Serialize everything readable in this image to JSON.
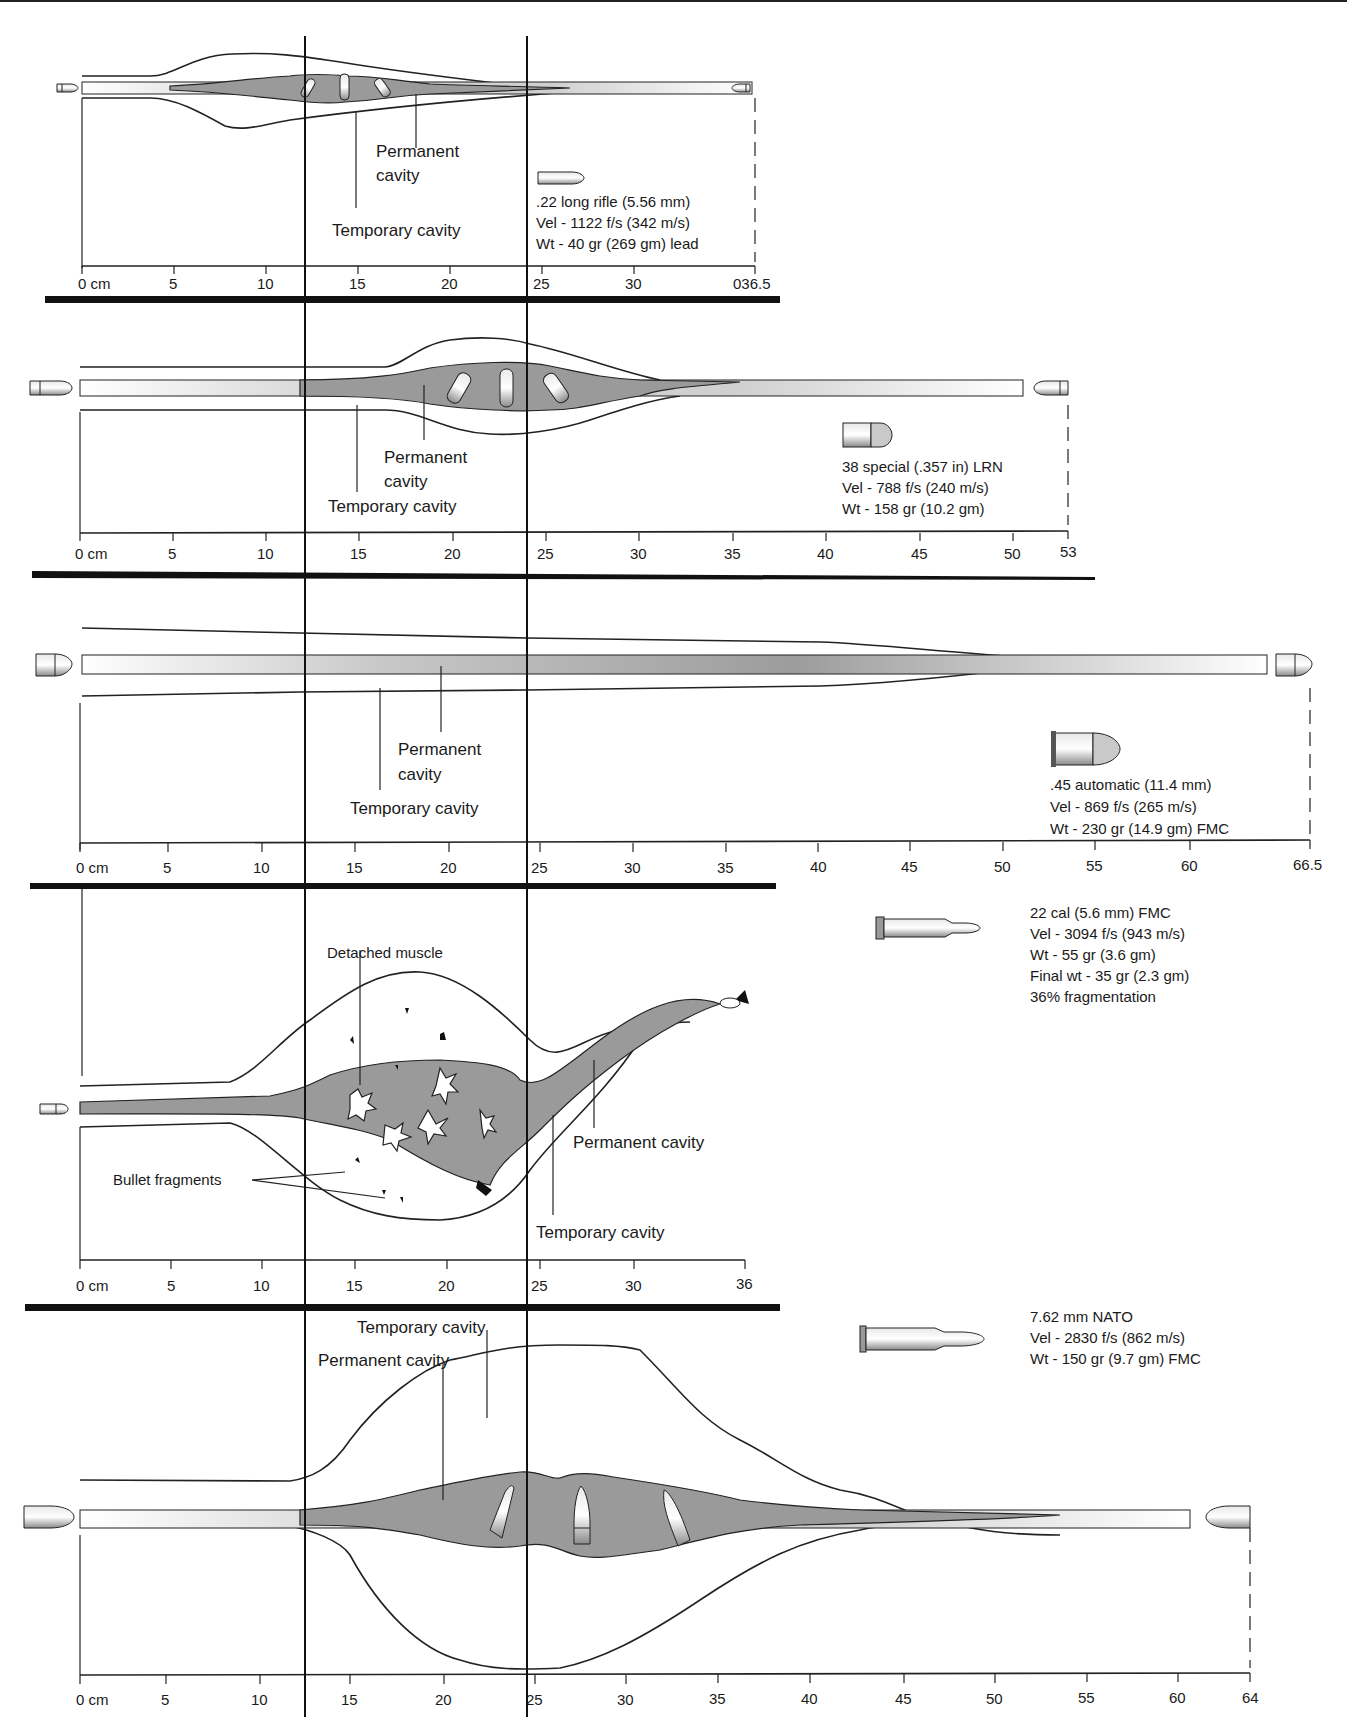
{
  "figure": {
    "reference_lines_x": [
      305,
      527
    ]
  },
  "panels": [
    {
      "id": "p1",
      "cartridge": ".22 long rifle (5.56 mm)",
      "velocity": "Vel - 1122 f/s (342 m/s)",
      "weight": "Wt - 40 gr (269 gm) lead",
      "labels": {
        "permanent_1": "Permanent",
        "permanent_2": "cavity",
        "temporary": "Temporary cavity"
      },
      "axis": {
        "ticks": [
          "0 cm",
          "5",
          "10",
          "15",
          "20",
          "25",
          "30",
          "036.5"
        ],
        "max_cm": 36.5
      }
    },
    {
      "id": "p2",
      "cartridge": "38 special (.357 in) LRN",
      "velocity": "Vel - 788 f/s (240 m/s)",
      "weight": "Wt - 158 gr (10.2 gm)",
      "labels": {
        "permanent_1": "Permanent",
        "permanent_2": "cavity",
        "temporary": "Temporary cavity"
      },
      "axis": {
        "ticks": [
          "0 cm",
          "5",
          "10",
          "15",
          "20",
          "25",
          "30",
          "35",
          "40",
          "45",
          "50",
          "53"
        ],
        "max_cm": 53
      }
    },
    {
      "id": "p3",
      "cartridge": ".45 automatic (11.4 mm)",
      "velocity": "Vel - 869 f/s (265 m/s)",
      "weight": "Wt - 230 gr (14.9 gm) FMC",
      "labels": {
        "permanent_1": "Permanent",
        "permanent_2": "cavity",
        "temporary": "Temporary cavity"
      },
      "axis": {
        "ticks": [
          "0 cm",
          "5",
          "10",
          "15",
          "20",
          "25",
          "30",
          "35",
          "40",
          "45",
          "50",
          "55",
          "60",
          "66.5"
        ],
        "max_cm": 66.5
      }
    },
    {
      "id": "p4",
      "cartridge": "22 cal (5.6 mm) FMC",
      "velocity": "Vel - 3094 f/s (943 m/s)",
      "weight": "Wt - 55 gr (3.6 gm)",
      "final_weight": "Final wt - 35 gr (2.3 gm)",
      "fragmentation": "36% fragmentation",
      "labels": {
        "detached": "Detached muscle",
        "fragments": "Bullet fragments",
        "permanent": "Permanent cavity",
        "temporary": "Temporary cavity"
      },
      "axis": {
        "ticks": [
          "0 cm",
          "5",
          "10",
          "15",
          "20",
          "25",
          "30",
          "36"
        ],
        "max_cm": 36
      }
    },
    {
      "id": "p5",
      "cartridge": "7.62 mm NATO",
      "velocity": "Vel - 2830 f/s (862 m/s)",
      "weight": "Wt - 150 gr (9.7 gm) FMC",
      "labels": {
        "temporary": "Temporary cavity",
        "permanent": "Permanent cavity"
      },
      "axis": {
        "ticks": [
          "0 cm",
          "5",
          "10",
          "15",
          "20",
          "25",
          "30",
          "35",
          "40",
          "45",
          "50",
          "55",
          "60",
          "64"
        ],
        "max_cm": 64
      }
    }
  ]
}
